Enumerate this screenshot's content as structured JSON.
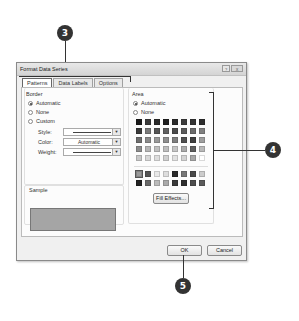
{
  "dialog": {
    "title": "Format Data Series",
    "window_buttons": [
      "?",
      "X"
    ],
    "tabs": [
      {
        "label": "Patterns",
        "active": true
      },
      {
        "label": "Data Labels",
        "active": false
      },
      {
        "label": "Options",
        "active": false
      }
    ],
    "border": {
      "heading": "Border",
      "options": [
        {
          "label": "Automatic",
          "selected": true
        },
        {
          "label": "None",
          "selected": false
        },
        {
          "label": "Custom",
          "selected": false
        }
      ],
      "style_label": "Style:",
      "color_label": "Color:",
      "color_value": "Automatic",
      "weight_label": "Weight:"
    },
    "sample": {
      "heading": "Sample",
      "color": "#a5a5a5"
    },
    "area": {
      "heading": "Area",
      "options": [
        {
          "label": "Automatic",
          "selected": true
        },
        {
          "label": "None",
          "selected": false
        }
      ],
      "palette_main": [
        "#1a1a1a",
        "#3a3a3a",
        "#2a2a2a",
        "#1f1f1f",
        "#2b2b2b",
        "#3c3c3c",
        "#333333",
        "#2e2e2e",
        "#3a3a3a",
        "#7a7a7a",
        "#555555",
        "#606060",
        "#4a4a4a",
        "#5a5a5a",
        "#6a6a6a",
        "#808080",
        "#6e6e6e",
        "#8a8a8a",
        "#9a9a9a",
        "#8e8e8e",
        "#7e7e7e",
        "#4e4e4e",
        "#3e3e3e",
        "#9e9e9e",
        "#8c8c8c",
        "#b5b5b5",
        "#c0c0c0",
        "#bdbdbd",
        "#c5c5c5",
        "#aaaaaa",
        "#5e5e5e",
        "#b8b8b8",
        "#c8c8c8",
        "#d8d8d8",
        "#dedede",
        "#d0d0d0",
        "#e2e2e2",
        "#d5d5d5",
        "#a8a8a8",
        "#ffffff"
      ],
      "palette_extra": [
        "#9a9a9a",
        "#555555",
        "#e8e8e8",
        "#dddddd",
        "#2a2a2a",
        "#777777",
        "#4a4a4a",
        "#cccccc",
        "#222222",
        "#6a6a6a",
        "#bbbbbb",
        "#aaaaaa",
        "#3a3a3a",
        "#2e2e2e",
        "#4e4e4e",
        "#5a5a5a"
      ],
      "fill_effects_label": "Fill Effects..."
    },
    "ok_label": "OK",
    "cancel_label": "Cancel"
  },
  "callouts": [
    {
      "number": "3",
      "target": "tabs"
    },
    {
      "number": "4",
      "target": "area-palette"
    },
    {
      "number": "5",
      "target": "ok-button"
    }
  ]
}
